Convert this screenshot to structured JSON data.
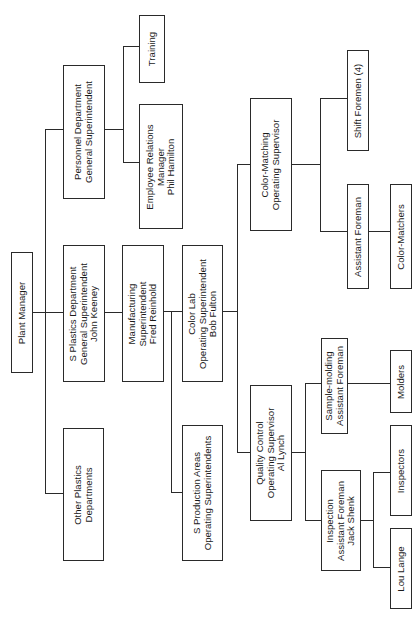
{
  "diagram": {
    "type": "organizational-chart",
    "orientation": "rotated-90-ccw",
    "nodes": {
      "plant_manager": {
        "lines": [
          "Plant Manager"
        ]
      },
      "personnel_dept": {
        "lines": [
          "Personnel Department",
          "General Superintendent"
        ]
      },
      "s_plastics_dept": {
        "lines": [
          "S Plastics Department",
          "General Superintendent",
          "John Keeney"
        ]
      },
      "other_plastics": {
        "lines": [
          "Other Plastics",
          "Departments"
        ]
      },
      "training": {
        "lines": [
          "Training"
        ]
      },
      "employee_relations": {
        "lines": [
          "Employee Relations",
          "Manager",
          "Phil Hamilton"
        ]
      },
      "manufacturing": {
        "lines": [
          "Manufacturing",
          "Superintendent",
          "Fred Reinhold"
        ]
      },
      "color_lab": {
        "lines": [
          "Color Lab",
          "Operating Superintendent",
          "Bob Fulton"
        ]
      },
      "s_production_areas": {
        "lines": [
          "S Production Areas",
          "Operating Superintendents"
        ]
      },
      "color_matching": {
        "lines": [
          "Color-Matching",
          "Operating Supervisor"
        ]
      },
      "quality_control": {
        "lines": [
          "Quality Control",
          "Operating Supervisor",
          "Al Lynch"
        ]
      },
      "shift_foremen": {
        "lines": [
          "Shift Foremen (4)"
        ]
      },
      "assistant_foreman": {
        "lines": [
          "Assistant Foreman"
        ]
      },
      "color_matchers": {
        "lines": [
          "Color-Matchers"
        ]
      },
      "sample_molding": {
        "lines": [
          "Sample-molding",
          "Assistant Foreman"
        ]
      },
      "molders": {
        "lines": [
          "Molders"
        ]
      },
      "inspection": {
        "lines": [
          "Inspection",
          "Assistant Foreman",
          "Jack Shenk"
        ]
      },
      "inspectors": {
        "lines": [
          "Inspectors"
        ]
      },
      "lou_lange": {
        "lines": [
          "Lou Lange"
        ]
      }
    },
    "edges": [
      [
        "plant_manager",
        "personnel_dept"
      ],
      [
        "plant_manager",
        "s_plastics_dept"
      ],
      [
        "plant_manager",
        "other_plastics"
      ],
      [
        "personnel_dept",
        "training"
      ],
      [
        "personnel_dept",
        "employee_relations"
      ],
      [
        "s_plastics_dept",
        "manufacturing"
      ],
      [
        "manufacturing",
        "color_lab"
      ],
      [
        "manufacturing",
        "s_production_areas"
      ],
      [
        "color_lab",
        "color_matching"
      ],
      [
        "color_lab",
        "quality_control"
      ],
      [
        "color_matching",
        "shift_foremen"
      ],
      [
        "color_matching",
        "assistant_foreman"
      ],
      [
        "assistant_foreman",
        "color_matchers"
      ],
      [
        "quality_control",
        "sample_molding"
      ],
      [
        "quality_control",
        "inspection"
      ],
      [
        "sample_molding",
        "molders"
      ],
      [
        "inspection",
        "inspectors"
      ],
      [
        "inspection",
        "lou_lange"
      ]
    ],
    "colors": {
      "line": "#2a2a2a",
      "background": "#ffffff",
      "text": "#1a1a1a"
    }
  }
}
